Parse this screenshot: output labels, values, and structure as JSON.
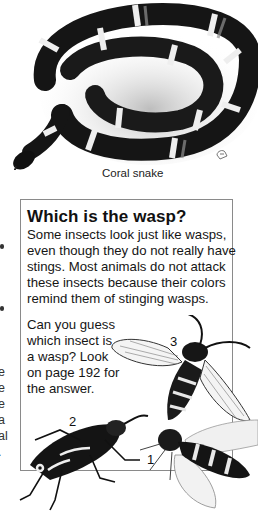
{
  "illustration_top": {
    "subject": "coral-snake",
    "caption": "Coral snake",
    "colors": {
      "band_dark": "#151515",
      "band_light": "#f2f2f2",
      "band_mid": "#8c8c8c"
    }
  },
  "sidebar_box": {
    "title": "Which is the wasp?",
    "body": "Some insects look just like wasps, even though they do not really have stings. Most animals do not attack these insects because their colors remind them of stinging wasps.",
    "question": "Can you guess which insect is a wasp? Look on page 192 for the answer.",
    "insect_labels": [
      "1",
      "2",
      "3"
    ]
  },
  "left_column_fragments": [
    "e",
    "e",
    "e",
    "a",
    "al",
    "."
  ]
}
